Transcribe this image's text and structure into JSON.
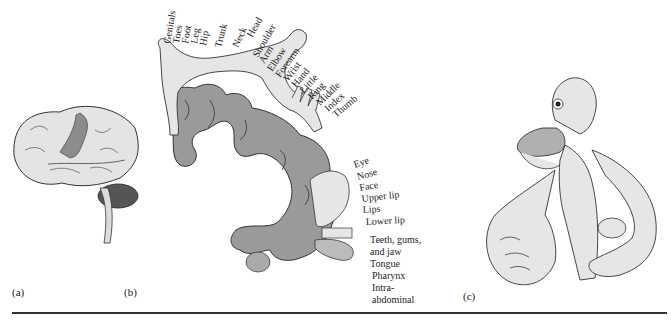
{
  "figure": {
    "panels": [
      {
        "id": "a",
        "label": "(a)",
        "subject": "lateral view of human brain with somatosensory cortex highlighted"
      },
      {
        "id": "b",
        "label": "(b)",
        "subject": "somatosensory homunculus mapped on cortex cross-section"
      },
      {
        "id": "c",
        "label": "(c)",
        "subject": "sensory homunculus figure with enlarged hands, lips, tongue"
      }
    ],
    "homunculus_labels_top": [
      "Genitals",
      "Toes",
      "Foot",
      "Leg",
      "Hip",
      "Trunk",
      "Neck",
      "Head",
      "Shoulder",
      "Arm",
      "Elbow",
      "Forearm",
      "Wrist",
      "Hand",
      "Little",
      "Ring",
      "Middle",
      "Index",
      "Thumb"
    ],
    "homunculus_labels_face": [
      "Eye",
      "Nose",
      "Face",
      "Upper lip",
      "Lips",
      "Lower lip"
    ],
    "homunculus_labels_bottom": [
      "Teeth, gums,",
      "and jaw",
      "Tongue",
      "Pharynx",
      "Intra-",
      "abdominal"
    ],
    "colors": {
      "cortex_fill": "#9a9a9a",
      "body_fill": "#e6e6e6",
      "highlight_band": "#8c8c8c",
      "outline": "#333333",
      "rule": "#333333"
    }
  }
}
